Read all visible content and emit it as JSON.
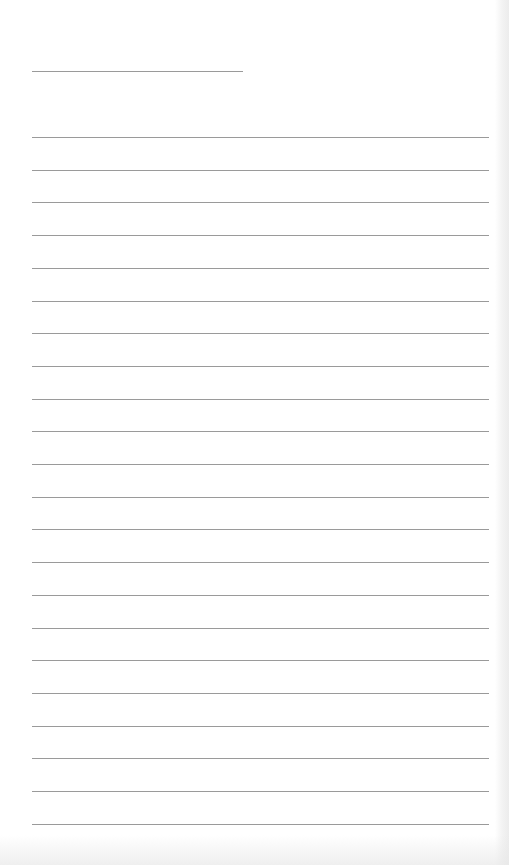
{
  "document": {
    "type": "lined-paper",
    "header_line": {
      "x": 32,
      "y": 71,
      "width": 211
    },
    "rules": {
      "count": 22,
      "start_y": 137,
      "spacing": 32.7,
      "x": 32,
      "width": 457
    },
    "colors": {
      "paper": "#ffffff",
      "rule": "#9a9a9a"
    }
  }
}
